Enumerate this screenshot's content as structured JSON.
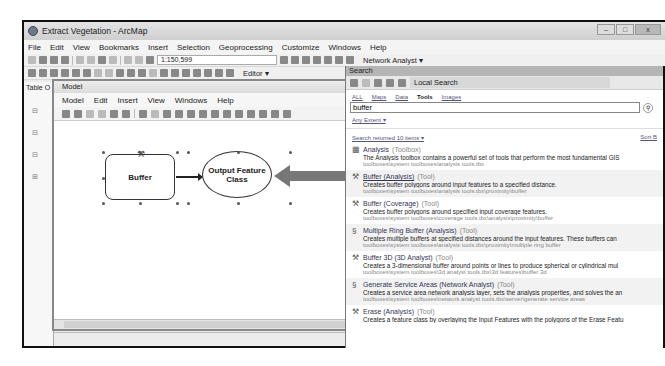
{
  "app": {
    "title": "Extract Vegetation - ArcMap",
    "window_controls": {
      "minimize": "–",
      "maximize": "□",
      "close": "x"
    },
    "menu": [
      "File",
      "Edit",
      "View",
      "Bookmarks",
      "Insert",
      "Selection",
      "Geoprocessing",
      "Customize",
      "Windows",
      "Help"
    ],
    "scale": "1:150,599",
    "editor_label": "Editor ▾",
    "network_analyst_label": "Network Analyst ▾",
    "toc_title": "Table O"
  },
  "model": {
    "title": "Model",
    "menu": [
      "Model",
      "Edit",
      "Insert",
      "View",
      "Windows",
      "Help"
    ],
    "process_label": "Buffer",
    "output_label": "Output Feature Class"
  },
  "search": {
    "title": "Search",
    "location": "Local Search",
    "filters": [
      "ALL",
      "Maps",
      "Data",
      "Tools",
      "Images"
    ],
    "active_filter": "Tools",
    "query": "buffer",
    "extent": "Any Extent ▾",
    "results_count": "Search returned 10 items ▾",
    "sort_label": "Sort B",
    "results": [
      {
        "icon": "toolbox-icon",
        "glyph": "▦",
        "name": "Analysis",
        "type": "(Toolbox)",
        "desc": "The Analysis toolbox contains a powerful set of tools that perform the most fundamental GIS",
        "path": "toolboxes\\system toolboxes\\analysis tools.tbx"
      },
      {
        "icon": "hammer-icon",
        "glyph": "⚒",
        "name": "Buffer (Analysis)",
        "type": "(Tool)",
        "desc": "Creates buffer polygons around input features to a specified distance.",
        "path": "toolboxes\\system toolboxes\\analysis tools.tbx\\proximity\\buffer"
      },
      {
        "icon": "hammer-icon",
        "glyph": "⚒",
        "name": "Buffer (Coverage)",
        "type": "(Tool)",
        "desc": "Creates buffer polygons around specified input coverage features.",
        "path": "toolboxes\\system toolboxes\\coverage tools.tbx\\analysis\\proximity\\buffer"
      },
      {
        "icon": "script-icon",
        "glyph": "§",
        "name": "Multiple Ring Buffer (Analysis)",
        "type": "(Tool)",
        "desc": "Creates multiple buffers at specified distances around the input features. These buffers can",
        "path": "toolboxes\\system toolboxes\\analysis tools.tbx\\proximity\\multiple ring buffer"
      },
      {
        "icon": "hammer-icon",
        "glyph": "⚒",
        "name": "Buffer 3D (3D Analyst)",
        "type": "(Tool)",
        "desc": "Creates a 3-dimensional buffer around points or lines to produce spherical or cylindrical mul",
        "path": "toolboxes\\system toolboxes\\3d analyst tools.tbx\\3d features\\buffer 3d"
      },
      {
        "icon": "script-icon",
        "glyph": "§",
        "name": "Generate Service Areas (Network Analyst)",
        "type": "(Tool)",
        "desc": "Creates a service area network analysis layer, sets the analysis properties, and solves the an",
        "path": "toolboxes\\system toolboxes\\network analyst tools.tbx\\server\\generate service areas"
      },
      {
        "icon": "hammer-icon",
        "glyph": "⚒",
        "name": "Erase (Analysis)",
        "type": "(Tool)",
        "desc": "Creates a feature class by overlaying the Input Features with the polygons of the Erase Featu",
        "path": ""
      }
    ]
  }
}
